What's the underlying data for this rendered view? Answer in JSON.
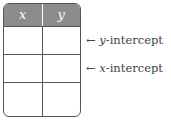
{
  "table": {
    "headers": [
      "x",
      "y"
    ],
    "rows": [
      [
        "",
        ""
      ],
      [
        "",
        ""
      ],
      [
        "",
        ""
      ]
    ]
  },
  "annotations": [
    {
      "arrow": "←",
      "var": "y",
      "text": "-intercept"
    },
    {
      "arrow": "←",
      "var": "x",
      "text": "-intercept"
    }
  ],
  "colors": {
    "header_bg": "#8c8c8c",
    "border": "#555555"
  }
}
